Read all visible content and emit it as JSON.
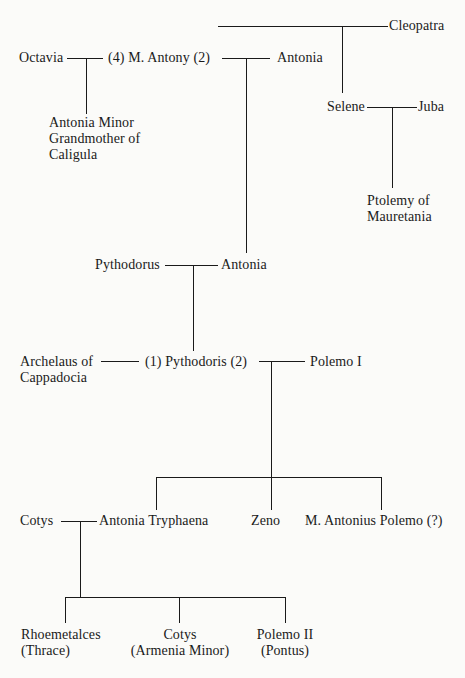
{
  "people": {
    "cleopatra": "Cleopatra",
    "octavia": "Octavia",
    "antony": "(4) M. Antony (2)",
    "antonia_top": "Antonia",
    "antonia_minor": [
      "Antonia Minor",
      "Grandmother of",
      "Caligula"
    ],
    "selene": "Selene",
    "juba": "Juba",
    "ptolemy": [
      "Ptolemy of",
      "Mauretania"
    ],
    "pythodorus": "Pythodorus",
    "antonia_mid": "Antonia",
    "archelaus": [
      "Archelaus of",
      "Cappadocia"
    ],
    "pythodoris": "(1) Pythodoris (2)",
    "polemo1": "Polemo I",
    "cotys_father": "Cotys",
    "antonia_tryphaena": "Antonia Tryphaena",
    "zeno": "Zeno",
    "antonius_polemo": "M. Antonius Polemo (?)",
    "rhoemetalces": [
      "Rhoemetalces",
      "(Thrace)"
    ],
    "cotys_son": [
      "Cotys",
      "(Armenia Minor)"
    ],
    "polemo2": [
      "Polemo II",
      "(Pontus)"
    ]
  },
  "relations": [
    {
      "type": "marriage",
      "partners": [
        "M. Antony",
        "Cleopatra"
      ],
      "children": [
        "Selene"
      ]
    },
    {
      "type": "marriage",
      "partners": [
        "Octavia",
        "M. Antony"
      ],
      "children": [
        "Antonia Minor"
      ]
    },
    {
      "type": "marriage",
      "partners": [
        "M. Antony",
        "Antonia"
      ],
      "children": [
        "Antonia"
      ]
    },
    {
      "type": "marriage",
      "partners": [
        "Selene",
        "Juba"
      ],
      "children": [
        "Ptolemy of Mauretania"
      ]
    },
    {
      "type": "marriage",
      "partners": [
        "Pythodorus",
        "Antonia"
      ],
      "children": [
        "Pythodoris"
      ]
    },
    {
      "type": "marriage",
      "partners": [
        "Archelaus of Cappadocia",
        "Pythodoris"
      ],
      "children": []
    },
    {
      "type": "marriage",
      "partners": [
        "Pythodoris",
        "Polemo I"
      ],
      "children": [
        "Antonia Tryphaena",
        "Zeno",
        "M. Antonius Polemo (?)"
      ]
    },
    {
      "type": "marriage",
      "partners": [
        "Cotys",
        "Antonia Tryphaena"
      ],
      "children": [
        "Rhoemetalces",
        "Cotys",
        "Polemo II"
      ]
    }
  ]
}
